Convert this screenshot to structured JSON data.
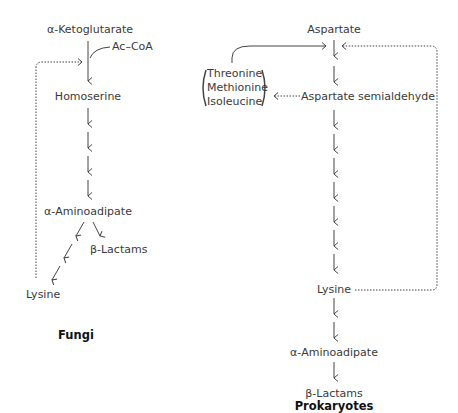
{
  "fungi": {
    "title": "Fungi",
    "nodes": {
      "ketoglutarate": "α-Ketoglutarate",
      "accoa": "Ac–CoA",
      "homoserine": "Homoserine",
      "aminoadipate": "α-Aminoadipate",
      "lactams": "β-Lactams",
      "lysine": "Lysine"
    }
  },
  "prokaryotes": {
    "title": "Prokaryotes",
    "nodes": {
      "aspartate": "Aspartate",
      "semialdehyde": "Aspartate semialdehyde",
      "threonine": "Threonine",
      "methionine": "Methionine",
      "isoleucine": "Isoleucine",
      "lysine": "Lysine",
      "aminoadipate": "α-Aminoadipate",
      "lactams": "β-Lactams"
    }
  },
  "colors": {
    "ink": "#3a3a3a",
    "title": "#111111"
  }
}
